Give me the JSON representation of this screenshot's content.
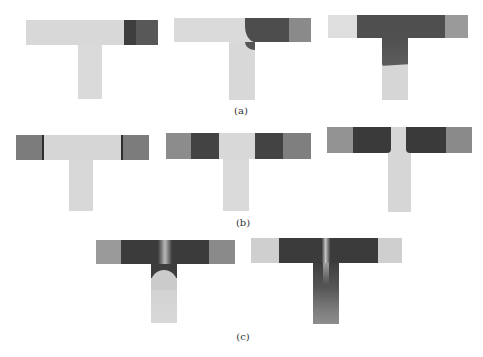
{
  "figure": {
    "panels": [
      {
        "label": "(a)",
        "id": "a"
      },
      {
        "label": "(b)",
        "id": "b"
      },
      {
        "label": "(c)",
        "id": "c"
      }
    ],
    "colors": {
      "light": "#d9d9d9",
      "medium": "#8f8f8f",
      "dark": "#4a4a4a",
      "darkest": "#333333",
      "background": "#ffffff"
    }
  }
}
